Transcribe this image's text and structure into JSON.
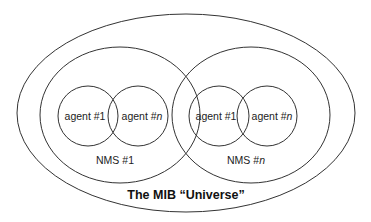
{
  "diagram": {
    "title": "The MIB “Universe”",
    "universe": {
      "label": "The MIB “Universe”"
    },
    "nms": [
      {
        "label_prefix": "NMS #",
        "label_suffix": "1",
        "suffix_italic": false,
        "agents": [
          {
            "prefix": "agent #",
            "suffix": "1",
            "suffix_italic": false
          },
          {
            "prefix": "agent #",
            "suffix": "n",
            "suffix_italic": true
          }
        ]
      },
      {
        "label_prefix": "NMS #",
        "label_suffix": "n",
        "suffix_italic": true,
        "agents": [
          {
            "prefix": "agent #",
            "suffix": "1",
            "suffix_italic": false
          },
          {
            "prefix": "agent #",
            "suffix": "n",
            "suffix_italic": true
          }
        ]
      }
    ],
    "colors": {
      "stroke": "#333333",
      "text": "#222222",
      "background": "#ffffff"
    }
  }
}
